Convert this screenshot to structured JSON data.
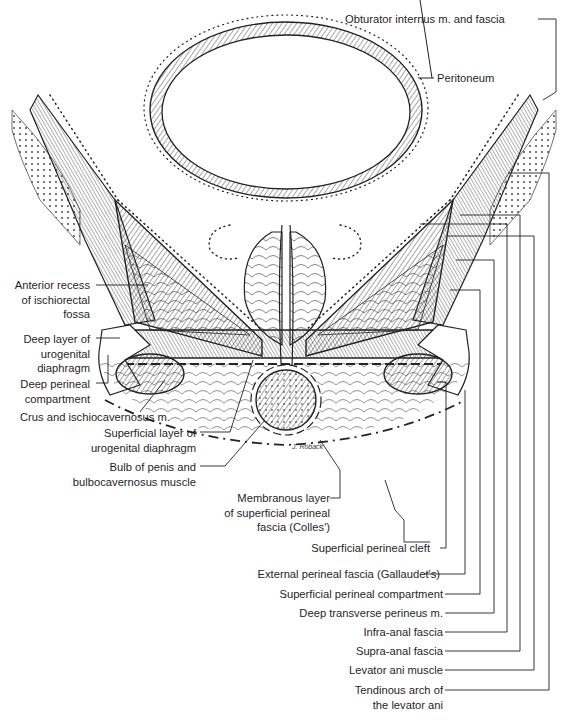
{
  "figure": {
    "type": "anatomical-illustration",
    "signature": "J. Roback"
  },
  "labels": {
    "top_right": {
      "obturator": "Obturator internus m. and fascia",
      "peritoneum": "Peritoneum"
    },
    "left": {
      "anterior_recess": [
        "Anterior recess",
        "of ischiorectal",
        "fossa"
      ],
      "deep_layer": [
        "Deep layer of",
        "urogenital",
        "diaphragm"
      ],
      "deep_compartment": [
        "Deep perineal",
        "compartment"
      ],
      "crus": "Crus and ischiocavernosus m.",
      "superficial_layer": [
        "Superficial layer of",
        "urogenital diaphragm"
      ],
      "bulb": [
        "Bulb of penis and",
        "bulbocavernosus muscle"
      ]
    },
    "bottom_right": {
      "membranous": [
        "Membranous layer",
        "of superficial perineal",
        "fascia (Colles')"
      ],
      "cleft": "Superficial perineal cleft",
      "external": "External perineal fascia (Gallaudet's)",
      "superficial_compartment": "Superficial perineal compartment",
      "deep_transverse": "Deep transverse perineus m.",
      "infra_anal": "Infra-anal fascia",
      "supra_anal": "Supra-anal fascia",
      "levator": "Levator ani muscle",
      "tendinous": [
        "Tendinous arch of",
        "the levator ani"
      ]
    }
  },
  "colors": {
    "ink": "#1a1a1a",
    "background": "#ffffff"
  }
}
